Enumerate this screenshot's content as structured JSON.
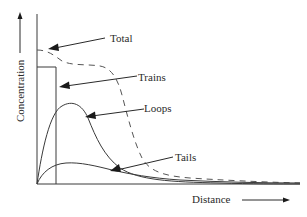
{
  "diagram": {
    "type": "concentration-profile",
    "axes": {
      "y_label": "Concentration",
      "x_label": "Distance",
      "y_arrow": "up-arrow",
      "x_arrow": "right-arrow"
    },
    "curves": [
      {
        "name": "Total",
        "style": "dashed",
        "label": "Total"
      },
      {
        "name": "Trains",
        "style": "solid-step",
        "label": "Trains"
      },
      {
        "name": "Loops",
        "style": "solid",
        "label": "Loops"
      },
      {
        "name": "Tails",
        "style": "solid",
        "label": "Tails"
      }
    ],
    "labels": {
      "total": "Total",
      "trains": "Trains",
      "loops": "Loops",
      "tails": "Tails",
      "concentration": "Concentration",
      "distance": "Distance"
    },
    "colors": {
      "line": "#3a3a3a",
      "text": "#2a2a2a",
      "background": "#ffffff"
    }
  }
}
